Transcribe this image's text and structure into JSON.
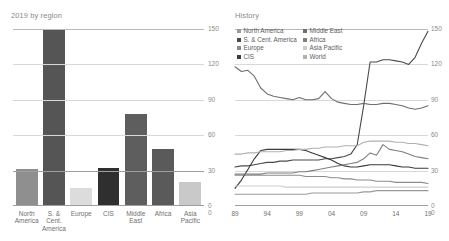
{
  "charts": {
    "bar": {
      "title": "2019 by region",
      "ytick_labels": [
        "150",
        "120",
        "90",
        "60",
        "30",
        "0"
      ],
      "categories_display": [
        "North\nAmerica",
        "S. & Cent.\nAmerica",
        "Europe",
        "CIS",
        "Middle\nEast",
        "Africa",
        "Asia\nPacific"
      ]
    },
    "line": {
      "title": "History",
      "ytick_labels": [
        "150",
        "120",
        "90",
        "60",
        "30",
        "0"
      ],
      "xtick_labels": [
        "89",
        "94",
        "99",
        "04",
        "09",
        "14",
        "19",
        "0"
      ],
      "legend": [
        {
          "label": "North America",
          "color": "#9a9a9a"
        },
        {
          "label": "Middle East",
          "color": "#6e6e6e"
        },
        {
          "label": "S. & Cent. America",
          "color": "#4a4a4a"
        },
        {
          "label": "Africa",
          "color": "#7f7f7f"
        },
        {
          "label": "Europe",
          "color": "#8c8c8c"
        },
        {
          "label": "Asia Pacific",
          "color": "#cdcdcd"
        },
        {
          "label": "CIS",
          "color": "#3a3a3a"
        },
        {
          "label": "World",
          "color": "#b0b0b0"
        }
      ]
    }
  },
  "chart_data": [
    {
      "type": "bar",
      "title": "2019 by region",
      "xlabel": "",
      "ylabel": "",
      "ylim": [
        0,
        150
      ],
      "yticks": [
        0,
        30,
        60,
        90,
        120,
        150
      ],
      "grid": true,
      "categories": [
        "North America",
        "S. & Cent. America",
        "Europe",
        "CIS",
        "Middle East",
        "Africa",
        "Asia Pacific"
      ],
      "values": [
        31,
        150,
        15,
        32,
        78,
        48,
        20
      ],
      "colors": [
        "#8f8f8f",
        "#555555",
        "#dcdcdc",
        "#2f2f2f",
        "#5e5e5e",
        "#5a5a5a",
        "#c9c9c9"
      ]
    },
    {
      "type": "line",
      "title": "History",
      "xlabel": "",
      "ylabel": "",
      "ylim": [
        0,
        150
      ],
      "yticks": [
        0,
        30,
        60,
        90,
        120,
        150
      ],
      "xlim": [
        1989,
        2019
      ],
      "xticks": [
        1989,
        1994,
        1999,
        2004,
        2009,
        2014,
        2019
      ],
      "grid": true,
      "legend_position": "top-left",
      "x": [
        1989,
        1990,
        1991,
        1992,
        1993,
        1994,
        1995,
        1996,
        1997,
        1998,
        1999,
        2000,
        2001,
        2002,
        2003,
        2004,
        2005,
        2006,
        2007,
        2008,
        2009,
        2010,
        2011,
        2012,
        2013,
        2014,
        2015,
        2016,
        2017,
        2018,
        2019
      ],
      "series": [
        {
          "name": "North America",
          "color": "#9a9a9a",
          "values": [
            10,
            10,
            10,
            10,
            10,
            10,
            10,
            10,
            10,
            10,
            10,
            10,
            11,
            11,
            11,
            11,
            11,
            11,
            11,
            11,
            12,
            12,
            13,
            13,
            13,
            13,
            13,
            13,
            13,
            13,
            13
          ]
        },
        {
          "name": "S. & Cent. America",
          "color": "#4a4a4a",
          "values": [
            33,
            34,
            34,
            35,
            36,
            37,
            37,
            38,
            38,
            39,
            39,
            39,
            39,
            39,
            40,
            40,
            41,
            42,
            44,
            52,
            85,
            122,
            122,
            124,
            124,
            123,
            122,
            120,
            126,
            138,
            148
          ]
        },
        {
          "name": "Europe",
          "color": "#8c8c8c",
          "values": [
            26,
            26,
            26,
            26,
            26,
            26,
            26,
            26,
            26,
            26,
            26,
            25,
            25,
            25,
            25,
            24,
            24,
            23,
            23,
            22,
            22,
            22,
            21,
            21,
            21,
            20,
            20,
            20,
            20,
            20,
            19
          ]
        },
        {
          "name": "CIS",
          "color": "#3a3a3a",
          "values": [
            15,
            22,
            31,
            40,
            47,
            48,
            48,
            48,
            48,
            48,
            48,
            47,
            45,
            43,
            41,
            39,
            36,
            34,
            33,
            33,
            34,
            35,
            35,
            35,
            35,
            34,
            33,
            33,
            32,
            32,
            32
          ]
        },
        {
          "name": "Middle East",
          "color": "#6e6e6e",
          "values": [
            118,
            114,
            115,
            110,
            100,
            95,
            93,
            92,
            91,
            90,
            92,
            90,
            90,
            91,
            97,
            91,
            88,
            87,
            86,
            86,
            87,
            86,
            86,
            87,
            87,
            86,
            85,
            83,
            82,
            83,
            85
          ]
        },
        {
          "name": "Africa",
          "color": "#7f7f7f",
          "values": [
            27,
            27,
            27,
            27,
            27,
            28,
            28,
            28,
            28,
            28,
            29,
            29,
            30,
            31,
            32,
            33,
            34,
            35,
            36,
            37,
            40,
            45,
            43,
            52,
            48,
            47,
            46,
            44,
            42,
            41,
            40
          ]
        },
        {
          "name": "Asia Pacific",
          "color": "#cdcdcd",
          "values": [
            17,
            17,
            17,
            17,
            17,
            17,
            17,
            17,
            16,
            16,
            16,
            16,
            16,
            16,
            16,
            16,
            16,
            16,
            16,
            16,
            16,
            16,
            16,
            16,
            16,
            16,
            16,
            16,
            16,
            16,
            16
          ]
        },
        {
          "name": "World",
          "color": "#b0b0b0",
          "values": [
            44,
            44,
            45,
            45,
            46,
            46,
            46,
            46,
            47,
            47,
            48,
            48,
            49,
            49,
            50,
            50,
            50,
            51,
            51,
            51,
            54,
            55,
            55,
            55,
            55,
            54,
            54,
            53,
            53,
            52,
            51
          ]
        }
      ]
    }
  ]
}
